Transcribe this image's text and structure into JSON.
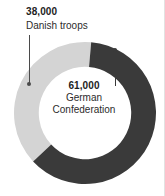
{
  "chart_data": {
    "type": "pie",
    "variant": "donut",
    "title": "",
    "subtitle": "",
    "xlabel": "",
    "ylabel": "",
    "total": 99000,
    "units": "troops",
    "legend_position": "callout-labels",
    "grid": false,
    "categories": [
      "German Confederation",
      "Danish troops"
    ],
    "values": [
      61000,
      38000
    ],
    "value_labels": [
      "61,000",
      "38,000"
    ],
    "percentages": [
      61.6,
      38.4
    ],
    "colors": [
      "#3a3a3a",
      "#d4d4d4"
    ],
    "slices": [
      {
        "name": "German Confederation",
        "value": 61000,
        "value_label": "61,000",
        "percent": 61.6,
        "color": "#3a3a3a",
        "start_angle_deg": 5,
        "end_angle_deg": 227,
        "label_lines": [
          "German",
          "Confederation"
        ]
      },
      {
        "name": "Danish troops",
        "value": 38000,
        "value_label": "38,000",
        "percent": 38.4,
        "color": "#d4d4d4",
        "start_angle_deg": 227,
        "end_angle_deg": 365,
        "label_lines": [
          "Danish troops"
        ]
      }
    ]
  },
  "callouts": {
    "danish": {
      "value": "38,000",
      "label": "Danish troops"
    },
    "german": {
      "value": "61,000",
      "label_line_1": "German",
      "label_line_2": "Confederation"
    }
  },
  "colors": {
    "german": "#3a3a3a",
    "danish": "#d4d4d4",
    "text": "#1d1d1d",
    "leader": "#4a4a4a",
    "background": "#ffffff"
  }
}
